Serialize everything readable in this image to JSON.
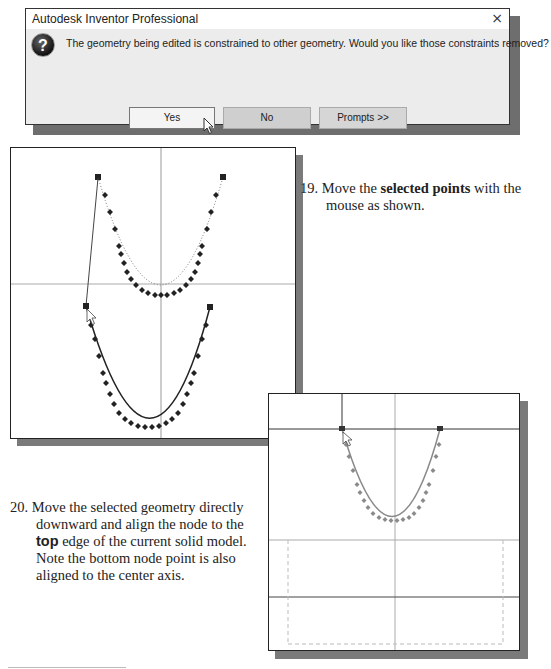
{
  "dialog": {
    "title": "Autodesk Inventor Professional",
    "close_glyph": "×",
    "icon": "question-icon",
    "icon_glyph": "?",
    "message": "The geometry being edited is constrained to other geometry. Would you like those constraints removed?",
    "buttons": {
      "yes": "Yes",
      "no": "No",
      "prompts": "Prompts >>"
    }
  },
  "steps": {
    "s19": {
      "number": "19.",
      "pre": "Move the ",
      "bold": "selected points",
      "post": " with the mouse as shown."
    },
    "s20": {
      "number": "20.",
      "line1": "Move the selected geometry directly downward and align the node to the ",
      "bold": "top",
      "line2": " edge of the current solid model. Note the bottom node point is also aligned to the center axis."
    }
  },
  "figures": {
    "fig1": {
      "description": "Two U-shaped spline curves; top curve being dragged down to new position",
      "point_color": "#222222"
    },
    "fig2": {
      "description": "Spline aligned to top edge of solid model",
      "point_color": "#8a8a8a"
    }
  }
}
